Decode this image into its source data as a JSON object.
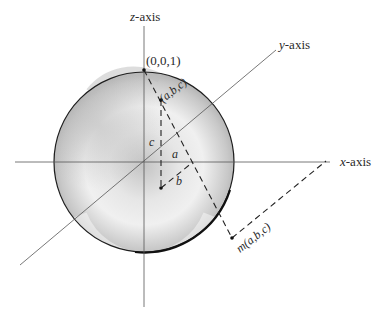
{
  "figure": {
    "type": "stereographic-projection",
    "colors": {
      "sphere_light": "#f2f2f2",
      "sphere_mid": "#c9c9c9",
      "sphere_dark": "#a9a9a9",
      "outline": "#1e1e1e",
      "axis": "#555555",
      "text": "#2a2a2a"
    },
    "axes": {
      "x": {
        "label": "x-axis",
        "italic_prefix": "x",
        "suffix": "-axis"
      },
      "y": {
        "label": "y-axis",
        "italic_prefix": "y",
        "suffix": "-axis"
      },
      "z": {
        "label": "z-axis",
        "italic_prefix": "z",
        "suffix": "-axis"
      }
    },
    "points": {
      "north_pole": {
        "label": "(0,0,1)"
      },
      "sphere_point": {
        "label": "(a,b,c)"
      },
      "projection": {
        "label": "m(a,b,c)"
      }
    },
    "segment_labels": {
      "a": "a",
      "b": "b",
      "c": "c"
    }
  }
}
